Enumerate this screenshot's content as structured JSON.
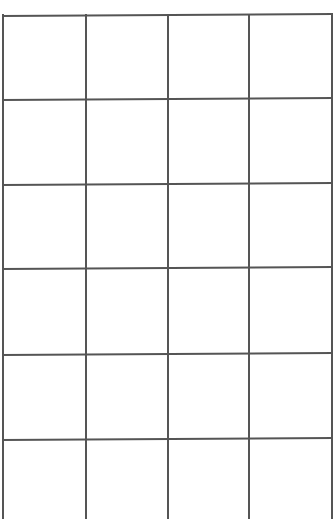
{
  "grid": {
    "columns": 4,
    "rows_with_top_border": 6,
    "line_color": "#555555",
    "background": "#ffffff",
    "left_x": 2,
    "right_x": 331,
    "vertical_x": [
      2,
      85,
      167,
      248,
      331
    ],
    "horizontal_y": [
      15,
      99,
      184,
      268,
      354,
      439
    ],
    "bottom_open": true,
    "cells_text": []
  }
}
